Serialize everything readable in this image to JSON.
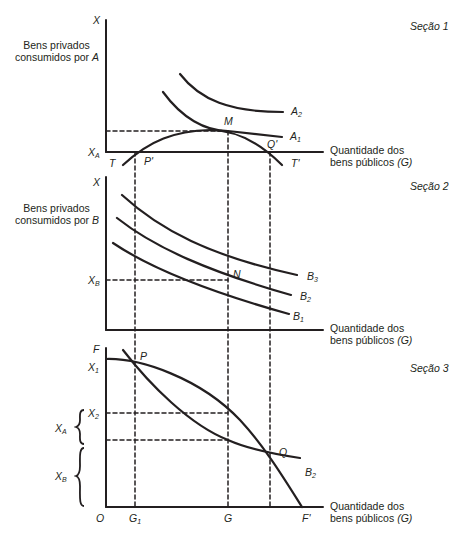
{
  "sections": [
    {
      "title": "Seção 1",
      "y_axis_symbol": "X",
      "y_axis_title_line1": "Bens privados",
      "y_axis_title_line2": "consumidos por ",
      "y_axis_title_agent": "A",
      "x_axis_title_line1": "Quantidade dos",
      "x_axis_title_line2": "bens públicos ",
      "x_axis_title_sym": "(G)",
      "tick_label": "X",
      "tick_sub": "A",
      "curves": [
        "A",
        "A"
      ],
      "curve_subs": [
        "2",
        "1"
      ],
      "points": {
        "M": "M",
        "P": "P'",
        "Q": "Q'",
        "T": "T",
        "T2": "T'"
      }
    },
    {
      "title": "Seção 2",
      "y_axis_symbol": "X",
      "y_axis_title_line1": "Bens privados",
      "y_axis_title_line2": "consumidos por ",
      "y_axis_title_agent": "B",
      "x_axis_title_line1": "Quantidade dos",
      "x_axis_title_line2": "bens públicos ",
      "x_axis_title_sym": "(G)",
      "tick_label": "X",
      "tick_sub": "B",
      "curves": [
        "B",
        "B",
        "B"
      ],
      "curve_subs": [
        "3",
        "2",
        "1"
      ],
      "points": {
        "N": "N"
      }
    },
    {
      "title": "Seção 3",
      "x_axis_title_line1": "Quantidade dos",
      "x_axis_title_line2": "bens públicos ",
      "x_axis_title_sym": "(G)",
      "y_labels": {
        "F": "F",
        "X1": "X",
        "X1_sub": "1",
        "X2": "X",
        "X2_sub": "2"
      },
      "brace_labels": {
        "XA": "X",
        "XA_sub": "A",
        "XB": "X",
        "XB_sub": "B"
      },
      "x_labels": {
        "O": "O",
        "G1": "G",
        "G1_sub": "1",
        "G": "G",
        "F2": "F'"
      },
      "curve": "B",
      "curve_sub": "2",
      "points": {
        "P": "P",
        "Q": "Q"
      }
    }
  ]
}
